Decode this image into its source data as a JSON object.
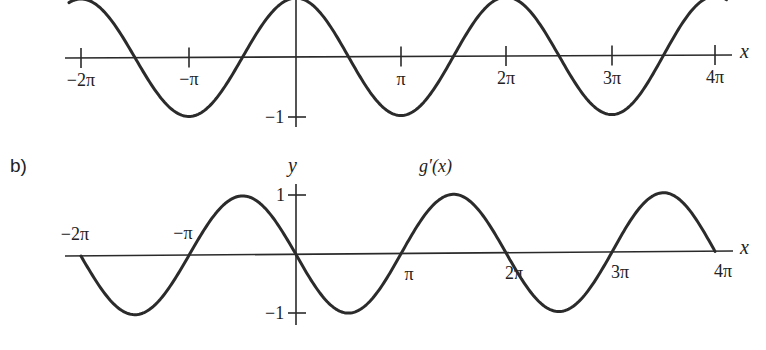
{
  "chart_data": [
    {
      "type": "line",
      "panel": "a",
      "function": "g(x) = cos(x)",
      "title": "",
      "xlabel": "x",
      "ylabel": "y",
      "xlim": [
        -6.2832,
        12.5664
      ],
      "ylim": [
        -1,
        1
      ],
      "x_ticks": [
        {
          "value": -6.2832,
          "label": "−2π"
        },
        {
          "value": -3.1416,
          "label": "−π"
        },
        {
          "value": 3.1416,
          "label": "π"
        },
        {
          "value": 6.2832,
          "label": "2π"
        },
        {
          "value": 9.4248,
          "label": "3π"
        },
        {
          "value": 12.5664,
          "label": "4π"
        }
      ],
      "y_ticks": [
        {
          "value": -1,
          "label": "−1"
        }
      ],
      "series": [
        {
          "name": "g(x)",
          "x": [
            -6.2832,
            -4.7124,
            -3.1416,
            -1.5708,
            0,
            1.5708,
            3.1416,
            4.7124,
            6.2832,
            7.854,
            9.4248,
            10.9956,
            12.5664
          ],
          "values": [
            1,
            0,
            -1,
            0,
            1,
            0,
            -1,
            0,
            1,
            0,
            -1,
            0,
            1
          ]
        }
      ],
      "grid": false,
      "legend": null
    },
    {
      "type": "line",
      "panel": "b",
      "function": "g'(x) = -sin(x)",
      "title": "g′(x)",
      "xlabel": "x",
      "ylabel": "y",
      "xlim": [
        -6.2832,
        12.5664
      ],
      "ylim": [
        -1,
        1
      ],
      "x_ticks": [
        {
          "value": -6.2832,
          "label": "−2π"
        },
        {
          "value": -3.1416,
          "label": "−π"
        },
        {
          "value": 3.1416,
          "label": "π"
        },
        {
          "value": 6.2832,
          "label": "2π"
        },
        {
          "value": 9.4248,
          "label": "3π"
        },
        {
          "value": 12.5664,
          "label": "4π"
        }
      ],
      "y_ticks": [
        {
          "value": 1,
          "label": "1"
        },
        {
          "value": -1,
          "label": "−1"
        }
      ],
      "series": [
        {
          "name": "g′(x)",
          "x": [
            -6.2832,
            -4.7124,
            -3.1416,
            -1.5708,
            0,
            1.5708,
            3.1416,
            4.7124,
            6.2832,
            7.854,
            9.4248,
            10.9956,
            12.5664
          ],
          "values": [
            0,
            -1,
            0,
            1,
            0,
            -1,
            0,
            1,
            0,
            -1,
            0,
            1,
            0
          ]
        }
      ],
      "grid": false,
      "legend": null
    }
  ],
  "labels": {
    "panel_b": "b)",
    "top_x_var": "x",
    "top_y_var": "y",
    "top_ymin": "−1",
    "bottom_x_var": "x",
    "bottom_y_var": "y",
    "bottom_ymax": "1",
    "bottom_ymin": "−1",
    "bottom_func": "g′(x)"
  },
  "colors": {
    "ink": "#2b2b2b",
    "background": "#ffffff"
  }
}
